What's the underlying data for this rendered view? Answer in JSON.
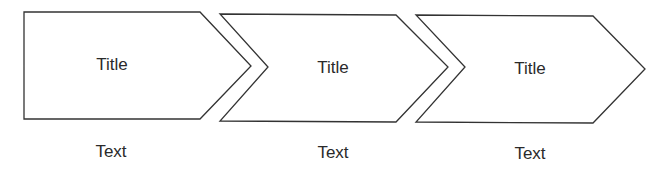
{
  "diagram": {
    "type": "chevron-process",
    "stroke_color": "#333333",
    "fill_color": "#ffffff",
    "steps": [
      {
        "title": "Title",
        "text": "Text"
      },
      {
        "title": "Title",
        "text": "Text"
      },
      {
        "title": "Title",
        "text": "Text"
      }
    ]
  }
}
